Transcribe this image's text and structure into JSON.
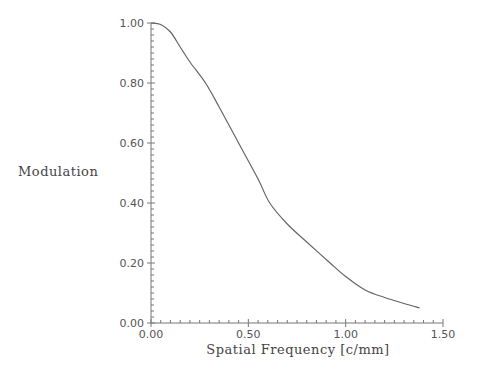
{
  "chart_data": {
    "type": "line",
    "title": "",
    "xlabel": "Spatial Frequency [c/mm]",
    "ylabel": "Modulation",
    "xlim": [
      0.0,
      1.5
    ],
    "ylim": [
      0.0,
      1.0
    ],
    "grid": false,
    "legend": null,
    "x_ticks": [
      "0.00",
      "0.50",
      "1.00",
      "1.50"
    ],
    "y_ticks": [
      "0.00",
      "0.20",
      "0.40",
      "0.60",
      "0.80",
      "1.00"
    ],
    "series": [
      {
        "name": "MTF",
        "x": [
          0.0,
          0.05,
          0.1,
          0.15,
          0.2,
          0.28,
          0.35,
          0.45,
          0.55,
          0.61,
          0.7,
          0.8,
          0.92,
          1.0,
          1.1,
          1.2,
          1.3,
          1.38
        ],
        "y": [
          1.0,
          0.995,
          0.97,
          0.92,
          0.87,
          0.8,
          0.72,
          0.6,
          0.48,
          0.4,
          0.33,
          0.27,
          0.2,
          0.155,
          0.11,
          0.085,
          0.065,
          0.05
        ]
      }
    ]
  },
  "axes": {
    "x_title": "Spatial Frequency [c/mm]",
    "y_title": "Modulation"
  }
}
